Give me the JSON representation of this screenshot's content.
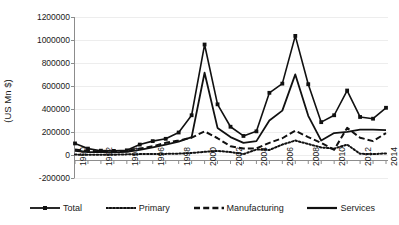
{
  "chart_data": {
    "type": "line",
    "title": "",
    "subtitle": "",
    "xlabel": "",
    "ylabel": "(US Mn $)",
    "ylim": [
      -200000,
      1200000
    ],
    "ytick_labels": [
      "1200000",
      "1000000",
      "800000",
      "600000",
      "400000",
      "200000",
      "0",
      "-200000"
    ],
    "ytick_values": [
      1200000,
      1000000,
      800000,
      600000,
      400000,
      200000,
      0,
      -200000
    ],
    "grid": true,
    "grid_axis": "y",
    "legend_position": "bottom",
    "x": [
      1990,
      1991,
      1992,
      1993,
      1994,
      1995,
      1996,
      1997,
      1998,
      1999,
      2000,
      2001,
      2002,
      2003,
      2004,
      2005,
      2006,
      2007,
      2008,
      2009,
      2010,
      2011,
      2012,
      2013,
      2014
    ],
    "xtick_labels": [
      "1990",
      "1992",
      "1994",
      "1996",
      "1998",
      "2000",
      "2002",
      "2004",
      "2006",
      "2008",
      "2010",
      "2012",
      "2014"
    ],
    "xtick_values": [
      1990,
      1992,
      1994,
      1996,
      1998,
      2000,
      2002,
      2004,
      2006,
      2008,
      2010,
      2012,
      2014
    ],
    "series": [
      {
        "name": "Total",
        "style": "solid-marker",
        "marker": "square",
        "color": "#111111",
        "values": [
          105000,
          60000,
          42000,
          40000,
          45000,
          95000,
          125000,
          145000,
          200000,
          350000,
          965000,
          445000,
          250000,
          170000,
          210000,
          545000,
          625000,
          1040000,
          620000,
          290000,
          350000,
          565000,
          335000,
          320000,
          415000
        ]
      },
      {
        "name": "Primary",
        "style": "dotted",
        "marker": "none",
        "color": "#111111",
        "values": [
          8000,
          6000,
          6000,
          7000,
          10000,
          12000,
          13000,
          14000,
          16000,
          22000,
          32000,
          40000,
          30000,
          12000,
          52000,
          48000,
          95000,
          130000,
          100000,
          70000,
          60000,
          95000,
          15000,
          12000,
          18000
        ]
      },
      {
        "name": "Manufacturing",
        "style": "dashed",
        "marker": "none",
        "color": "#111111",
        "values": [
          52000,
          40000,
          35000,
          32000,
          40000,
          60000,
          80000,
          110000,
          130000,
          155000,
          210000,
          150000,
          80000,
          60000,
          62000,
          110000,
          150000,
          215000,
          160000,
          110000,
          50000,
          240000,
          155000,
          125000,
          195000
        ]
      },
      {
        "name": "Services",
        "style": "solid",
        "marker": "none",
        "color": "#111111",
        "values": [
          40000,
          30000,
          30000,
          28000,
          32000,
          48000,
          70000,
          95000,
          120000,
          160000,
          720000,
          240000,
          160000,
          110000,
          125000,
          305000,
          390000,
          705000,
          345000,
          130000,
          195000,
          205000,
          225000,
          225000,
          220000
        ]
      }
    ]
  },
  "legend": {
    "items": [
      {
        "label": "Total",
        "swatch": "line-square-marker"
      },
      {
        "label": "Primary",
        "swatch": "dotted-line"
      },
      {
        "label": "Manufacturing",
        "swatch": "dashed-line"
      },
      {
        "label": "Services",
        "swatch": "solid-line"
      }
    ]
  }
}
